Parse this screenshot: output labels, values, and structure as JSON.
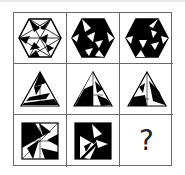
{
  "puzzle": {
    "type": "3x3 figure reasoning matrix",
    "rows": [
      {
        "shape": "hexagon",
        "cells": [
          {
            "label": "hexagon-variant-1",
            "fill": "mostly white with black triangles"
          },
          {
            "label": "hexagon-variant-2",
            "fill": "mostly black with white triangles"
          },
          {
            "label": "hexagon-variant-3",
            "fill": "mostly black with white triangles"
          }
        ]
      },
      {
        "shape": "triangle",
        "cells": [
          {
            "label": "triangle-variant-1"
          },
          {
            "label": "triangle-variant-2"
          },
          {
            "label": "triangle-variant-3"
          }
        ]
      },
      {
        "shape": "square",
        "cells": [
          {
            "label": "square-variant-1"
          },
          {
            "label": "square-variant-2"
          },
          {
            "label": "unknown",
            "text": "?"
          }
        ]
      }
    ],
    "colors": {
      "ink": "#000000",
      "paper": "#ffffff",
      "grid": "#6a6a6a"
    }
  }
}
